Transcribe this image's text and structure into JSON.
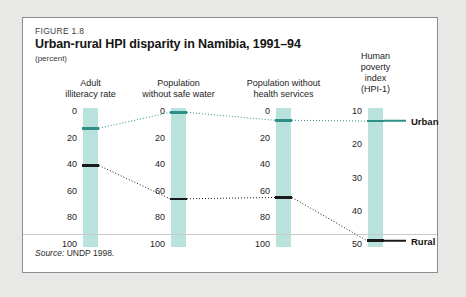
{
  "figure": {
    "number": "FIGURE 1.8",
    "title": "Urban-rural HPI disparity in Namibia, 1991–94",
    "units": "(percent)",
    "source_word": "Source:",
    "source_text": " UNDP 1998."
  },
  "legend": {
    "urban": "Urban",
    "rural": "Rural",
    "urban_color": "#2f8f86",
    "rural_color": "#1a1a1a",
    "bar_color": "#b9e2dd"
  },
  "chart_data": {
    "type": "line",
    "title": "Urban-rural HPI disparity in Namibia, 1991–94",
    "subtitle": "(percent)",
    "ylabel": "(percent)",
    "grid": false,
    "legend_position": "right",
    "series": [
      {
        "name": "Urban",
        "color": "#2f8f86",
        "values": [
          13,
          1,
          7,
          13
        ]
      },
      {
        "name": "Rural",
        "color": "#1a1a1a",
        "values": [
          41,
          66,
          65,
          49
        ]
      }
    ],
    "categories": [
      "Adult illiteracy rate",
      "Population without safe water",
      "Population without health services",
      "Human poverty index (HPI-1)"
    ],
    "axes": [
      {
        "header": [
          "Adult",
          "illiteracy rate"
        ],
        "ticks": [
          0,
          20,
          40,
          60,
          80,
          100
        ],
        "range": [
          0,
          100
        ],
        "urban": 13,
        "rural": 41
      },
      {
        "header": [
          "Population",
          "without safe water"
        ],
        "ticks": [
          0,
          20,
          40,
          60,
          80,
          100
        ],
        "range": [
          0,
          100
        ],
        "urban": 1,
        "rural": 66
      },
      {
        "header": [
          "Population without",
          "health services"
        ],
        "ticks": [
          0,
          20,
          40,
          60,
          80,
          100
        ],
        "range": [
          0,
          100
        ],
        "urban": 7,
        "rural": 65
      },
      {
        "header": [
          "Human",
          "poverty",
          "index",
          "(HPI-1)"
        ],
        "ticks": [
          10,
          20,
          30,
          40,
          50
        ],
        "range": [
          10,
          50
        ],
        "urban": 13,
        "rural": 49
      }
    ]
  }
}
